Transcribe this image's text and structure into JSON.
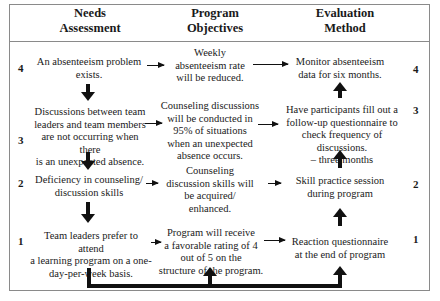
{
  "headers": {
    "needs": "Needs\nAssessment",
    "objectives": "Program\nObjectives",
    "evaluation": "Evaluation\nMethod"
  },
  "levels": {
    "left": [
      "4",
      "3",
      "2",
      "1"
    ],
    "right": [
      "4",
      "3",
      "2",
      "1"
    ]
  },
  "needs": [
    "An absenteeism problem\nexists.",
    "Discussions between team\nleaders and team members\nare not occurring when there\nis an unexpected absence.",
    "Deficiency in counseling/\ndiscussion skills",
    "Team leaders prefer to attend\na learning program on a one-\nday-per-week basis."
  ],
  "objectives": [
    "Weekly\nabsenteeism rate\nwill be reduced.",
    "Counseling discussions\nwill be conducted in\n95% of situations\nwhen an unexpected\nabsence occurs.",
    "Counseling\ndiscussion skills will\nbe acquired/\nenhanced.",
    "Program will receive\na favorable rating of 4\nout of 5 on the\nstructure of the program."
  ],
  "evaluation": [
    "Monitor absenteeism\ndata for six months.",
    "Have participants fill out a\nfollow-up questionnaire to\ncheck frequency of discussions.\n– three months",
    "Skill practice session\nduring program",
    "Reaction questionnaire\nat the end of program"
  ]
}
